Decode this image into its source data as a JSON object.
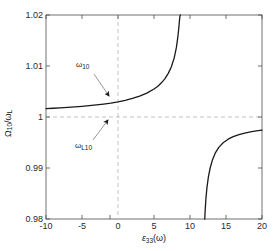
{
  "chart_data": {
    "type": "line",
    "title": "",
    "xlabel": "ε₃₃(ω)",
    "ylabel": "Ω₁₀/ω_L",
    "xlim": [
      -10,
      20
    ],
    "ylim": [
      0.98,
      1.02
    ],
    "xticks": [
      -10,
      -5,
      0,
      5,
      10,
      15,
      20
    ],
    "yticks": [
      0.98,
      0.99,
      1,
      1.01,
      1.02
    ],
    "xtick_labels": [
      "-10",
      "-5",
      "0",
      "5",
      "10",
      "15",
      "20"
    ],
    "ytick_labels": [
      "0.98",
      "0.99",
      "1",
      "1.01",
      "1.02"
    ],
    "grid": false,
    "legend": "none",
    "reference_lines": [
      {
        "name": "y-equals-one",
        "orientation": "horizontal",
        "value": 1.0,
        "style": "dashed"
      },
      {
        "name": "x-equals-zero",
        "orientation": "vertical",
        "value": 0.0,
        "style": "dashed"
      }
    ],
    "asymptotes": {
      "vertical": [
        8.7,
        12.0
      ],
      "horizontal": [
        1.0
      ]
    },
    "series": [
      {
        "name": "branch-left",
        "color": "#1a1a1a",
        "x": [
          -10,
          -9,
          -8,
          -7,
          -6,
          -5,
          -4,
          -3,
          -2,
          -1,
          0,
          1,
          2,
          3,
          4,
          5,
          5.5,
          6,
          6.5,
          7,
          7.4,
          7.8,
          8.1,
          8.3,
          8.45,
          8.55,
          8.62,
          8.67
        ],
        "y": [
          1.00165,
          1.00172,
          1.0018,
          1.00189,
          1.00199,
          1.0021,
          1.00222,
          1.00237,
          1.00254,
          1.00274,
          1.00298,
          1.00327,
          1.00363,
          1.00408,
          1.00467,
          1.00548,
          1.006,
          1.00665,
          1.00748,
          1.0086,
          1.0098,
          1.01155,
          1.01355,
          1.01555,
          1.01755,
          1.01915,
          1.0199,
          1.02
        ]
      },
      {
        "name": "branch-right",
        "color": "#1a1a1a",
        "x": [
          12.05,
          12.1,
          12.2,
          12.35,
          12.55,
          12.8,
          13.1,
          13.5,
          14,
          14.6,
          15.3,
          16,
          16.8,
          17.6,
          18.4,
          19.2,
          20
        ],
        "y": [
          0.98,
          0.9815,
          0.9838,
          0.9861,
          0.9882,
          0.99,
          0.9915,
          0.9929,
          0.99405,
          0.99495,
          0.99565,
          0.99615,
          0.99655,
          0.99685,
          0.99708,
          0.99726,
          0.99742
        ]
      }
    ],
    "annotations": [
      {
        "name": "omega-10",
        "text_main": "ω",
        "text_sub": "10",
        "label_x": 76,
        "label_y": 60,
        "arrow_from": [
          94,
          74
        ],
        "arrow_to": [
          110,
          97
        ]
      },
      {
        "name": "omega-L10",
        "text_main": "ω",
        "text_sub": "L10",
        "label_x": 75,
        "label_y": 141,
        "arrow_from": [
          93,
          140
        ],
        "arrow_to": [
          109,
          119
        ]
      }
    ]
  },
  "axes": {
    "xlabel_main": "ε",
    "xlabel_sub": "33",
    "xlabel_tail": "(ω)",
    "ylabel_main": "Ω",
    "ylabel_sub": "10",
    "ylabel_mid": "/ω",
    "ylabel_sub2": "L"
  },
  "colors": {
    "curve": "#1a1a1a",
    "axis": "#4d4d4d",
    "dashed": "#b3b3b3",
    "background": "#ffffff",
    "text": "#1a1a1a"
  }
}
